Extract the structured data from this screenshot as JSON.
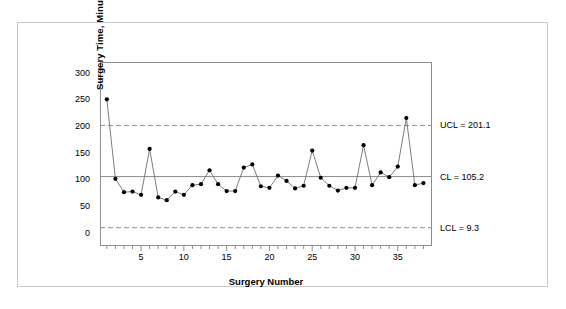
{
  "chart_data": {
    "type": "line",
    "title": "",
    "xlabel": "Surgery Number",
    "ylabel": "Surgery Time, Minutes",
    "xlim": [
      0.2,
      39.0
    ],
    "ylim": [
      -25,
      320
    ],
    "grid": false,
    "legend_position": "right-outside-labels",
    "x": [
      1,
      2,
      3,
      4,
      5,
      6,
      7,
      8,
      9,
      10,
      11,
      12,
      13,
      14,
      15,
      16,
      17,
      18,
      19,
      20,
      21,
      22,
      23,
      24,
      25,
      26,
      27,
      28,
      29,
      30,
      31,
      32,
      33,
      34,
      35,
      36,
      37,
      38
    ],
    "series": [
      {
        "name": "Surgery Time",
        "values": [
          250,
          101,
          76,
          77,
          71,
          157,
          66,
          61,
          77,
          71,
          89,
          91,
          117,
          91,
          78,
          78,
          122,
          128,
          87,
          84,
          107,
          97,
          83,
          88,
          154,
          103,
          88,
          79,
          84,
          84,
          164,
          89,
          113,
          104,
          124,
          215,
          89,
          93
        ]
      }
    ],
    "control_limits": {
      "ucl": {
        "value": 201.1,
        "label": "UCL = 201.1",
        "style": "dashed"
      },
      "cl": {
        "value": 105.2,
        "label": "CL = 105.2",
        "style": "solid"
      },
      "lcl": {
        "value": 9.3,
        "label": "LCL = 9.3",
        "style": "dashed"
      }
    },
    "y_ticks": [
      0,
      50,
      100,
      150,
      200,
      250,
      300
    ],
    "x_ticks": [
      5,
      10,
      15,
      20,
      25,
      30,
      35
    ],
    "x_minor_tick_step": 1,
    "colors": {
      "line": "#6e6e6e",
      "marker": "#000000",
      "center_line": "#8d8d8d",
      "limit_line": "#8d8d8d",
      "frame": "#8d8d8d",
      "outer_frame": "#c9c9c9",
      "text": "#000000",
      "background": "#ffffff"
    }
  }
}
